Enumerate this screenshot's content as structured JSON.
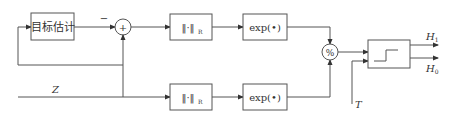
{
  "diagram": {
    "type": "block-diagram",
    "blocks": {
      "target_estimation": {
        "label": "目标估计"
      },
      "norm_top": {
        "label": "‖·‖",
        "subscript": "R"
      },
      "exp_top": {
        "label": "exp(•)"
      },
      "norm_bottom": {
        "label": "‖·‖",
        "subscript": "R"
      },
      "exp_bottom": {
        "label": "exp(•)"
      },
      "threshold": {
        "label": "step"
      }
    },
    "junctions": {
      "sum": {
        "symbol": "+",
        "minus_label": "−"
      },
      "divide": {
        "symbol": "%"
      }
    },
    "signals": {
      "input": "Z",
      "threshold_input": "T",
      "output_h1": "H",
      "output_h1_sub": "1",
      "output_h0": "H",
      "output_h0_sub": "0"
    },
    "colors": {
      "line": "#555555",
      "text": "#333333",
      "background": "#ffffff"
    }
  }
}
